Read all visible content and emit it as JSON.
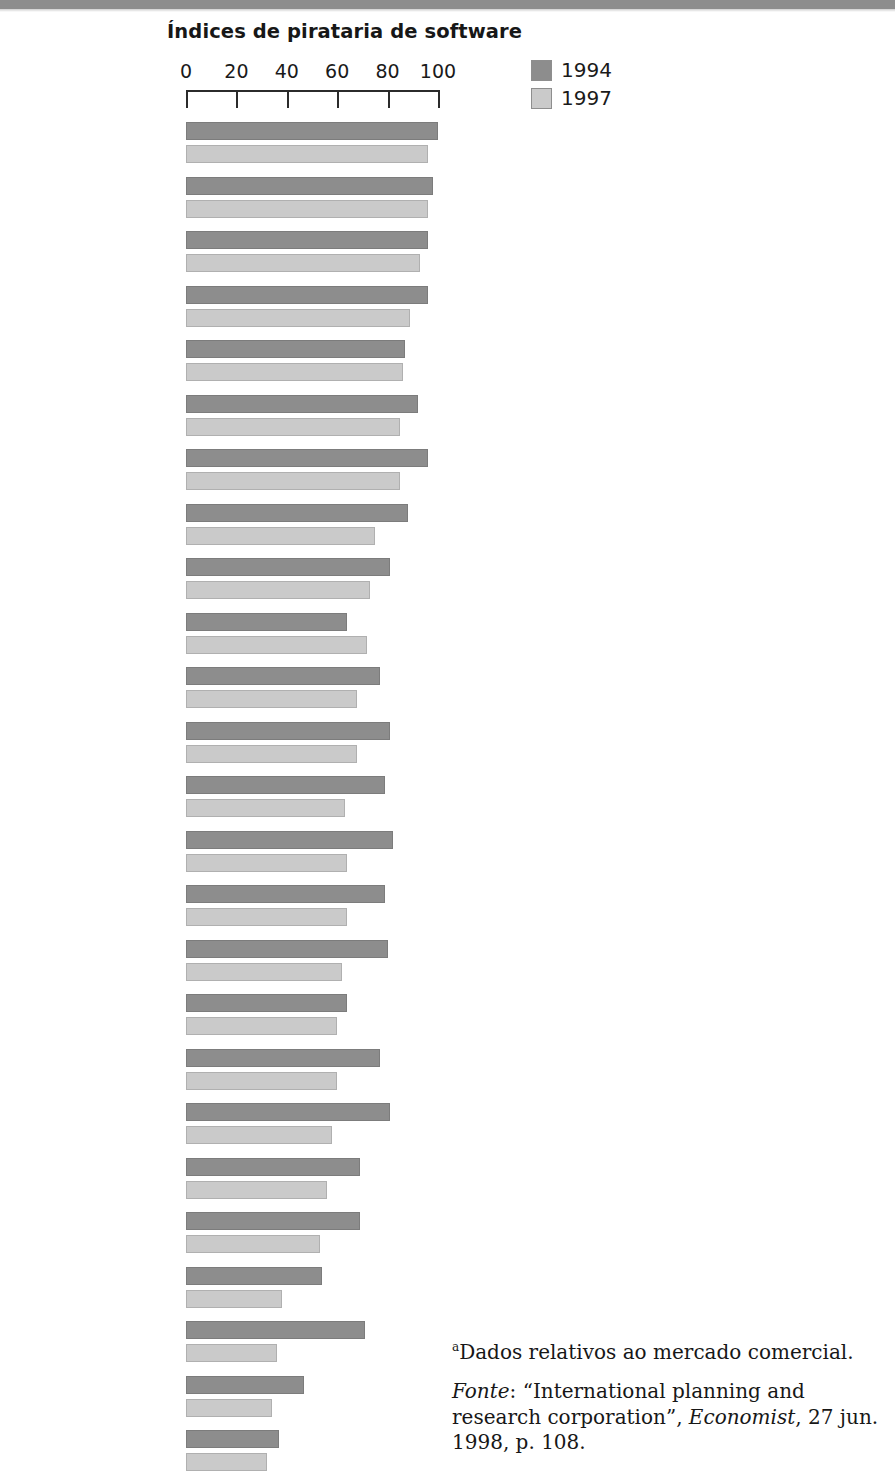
{
  "chart_data": {
    "type": "bar",
    "orientation": "horizontal",
    "title": "Índices de pirataria de software",
    "xlabel": "",
    "ylabel": "",
    "xlim": [
      0,
      100
    ],
    "xticks": [
      0,
      20,
      40,
      60,
      80,
      100
    ],
    "grid": false,
    "legend_position": "top-right",
    "colors": {
      "1994": "#8d8d8d",
      "1997": "#cacaca"
    },
    "categories": [
      "Vietnã",
      "China",
      "Indonésia",
      "Rússia",
      "Tailândia",
      "Turquia",
      "Filipinas",
      "Grécia",
      "Índia",
      "Hong Kong",
      "Coréia do Sul",
      "Argentina",
      "Brasil",
      "México",
      "Polônia",
      "Hungria",
      "Cingapura",
      "Chile",
      "Israel",
      "República Tcheca",
      "África do Sul",
      "Alemanha",
      "Japão",
      "Inglaterra",
      "Estados Unidos"
    ],
    "series": [
      {
        "name": "1994",
        "values": [
          100,
          98,
          96,
          96,
          87,
          92,
          96,
          88,
          81,
          64,
          77,
          81,
          79,
          82,
          79,
          80,
          64,
          77,
          81,
          69,
          69,
          54,
          71,
          47,
          37
        ]
      },
      {
        "name": "1997",
        "values": [
          96,
          96,
          93,
          89,
          86,
          85,
          85,
          75,
          73,
          72,
          68,
          68,
          63,
          64,
          64,
          62,
          60,
          60,
          58,
          56,
          53,
          38,
          36,
          34,
          32
        ]
      }
    ],
    "legend": [
      "1994",
      "1997"
    ]
  },
  "notes": {
    "footnote_marker": "a",
    "footnote_text": "Dados relativos ao mercado comercial.",
    "source_label": "Fonte",
    "source_text": ": “International planning and research corporation”, ",
    "source_publication": "Economist",
    "source_tail": ", 27 jun. 1998, p. 108."
  }
}
